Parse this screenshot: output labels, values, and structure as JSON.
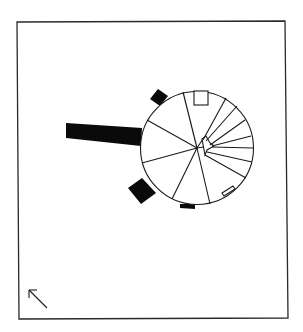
{
  "diagram": {
    "type": "architectural-plan",
    "elements": {
      "frame": "border-frame",
      "circle": "rotunda",
      "radial_divisions": 12,
      "attached_bar": "walkway",
      "projections": [
        "buttress-upper-left",
        "buttress-lower-left",
        "buttress-bottom"
      ],
      "openings": [
        "top-opening",
        "lower-right-opening"
      ],
      "orientation_arrow": "north-arrow"
    },
    "colors": {
      "ink": "#0a0a0a",
      "background": "#ffffff"
    }
  }
}
